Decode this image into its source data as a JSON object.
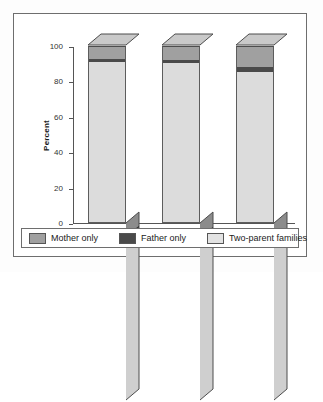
{
  "chart_data": {
    "type": "bar",
    "subtype": "stacked-column-3d",
    "title": "",
    "xlabel": "",
    "ylabel": "Percent",
    "ylim": [
      0,
      100
    ],
    "yticks": [
      0,
      20,
      40,
      60,
      80,
      100
    ],
    "ytick_labels": [
      "0",
      "20",
      "40",
      "60",
      "80",
      "100"
    ],
    "grid": false,
    "legend_position": "bottom",
    "categories": [
      "1961",
      "1976",
      "1996"
    ],
    "series": [
      {
        "name": "Two-parent families",
        "color": "#dcdcdc",
        "values": [
          91.0,
          90.5,
          85.5
        ]
      },
      {
        "name": "Father only",
        "color": "#4a4a4a",
        "values": [
          1.5,
          1.5,
          2.5
        ]
      },
      {
        "name": "Mother only",
        "color": "#a0a0a0",
        "values": [
          7.5,
          8.0,
          12.0
        ]
      }
    ]
  },
  "legend": {
    "items": [
      {
        "label": "Mother only",
        "color": "#a0a0a0"
      },
      {
        "label": "Father only",
        "color": "#4a4a4a"
      },
      {
        "label": "Two-parent families",
        "color": "#e2e2e2"
      }
    ]
  }
}
